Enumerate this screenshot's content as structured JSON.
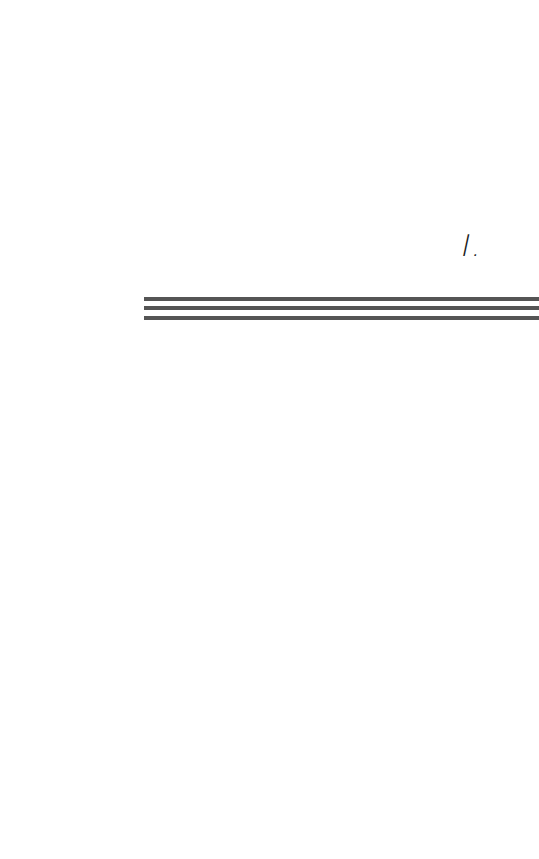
{
  "page": {
    "section_number": "I.",
    "rule_color": "#555555",
    "rule_count": 3
  }
}
